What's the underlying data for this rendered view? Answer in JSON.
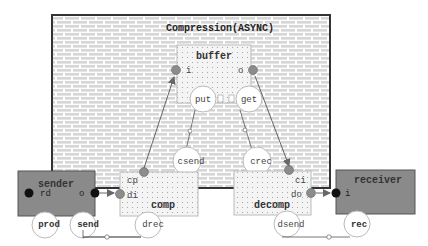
{
  "diagram": {
    "title": "Compression(ASYNC)",
    "components": {
      "buffer": {
        "label": "buffer",
        "port_in": "i",
        "port_out": "o"
      },
      "comp": {
        "label": "comp",
        "port_cp": "cp",
        "port_di": "di"
      },
      "decomp": {
        "label": "decomp",
        "port_ci": "ci",
        "port_do": "do"
      },
      "sender": {
        "label": "sender",
        "port_rd": "rd",
        "port_o": "o"
      },
      "receiver": {
        "label": "receiver",
        "port_i": "i"
      }
    },
    "services": {
      "put": "put",
      "get": "get",
      "csend": "csend",
      "crec": "crec",
      "drec": "drec",
      "dsend": "dsend",
      "prod": "prod",
      "send": "send",
      "rec": "rec"
    },
    "colors": {
      "outer_border": "#333333",
      "brick_fill": "#d9d9d9",
      "brick_mortar": "#ffffff",
      "dotted_box": "#f3f3f3",
      "dark_box": "#8a8a8a",
      "port_grey": "#8c8c8c",
      "port_black": "#111111",
      "arrow": "#666666"
    }
  }
}
